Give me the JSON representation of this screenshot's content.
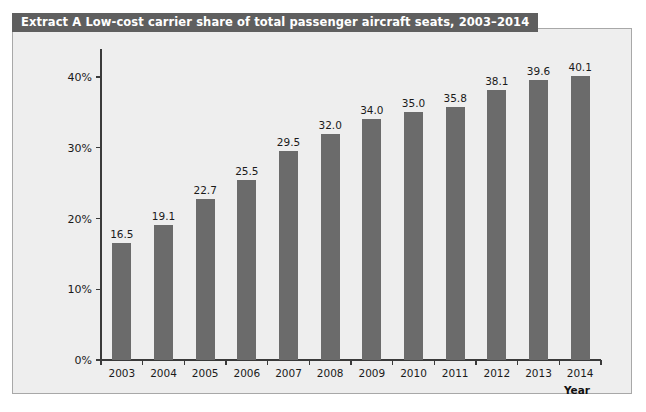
{
  "header": {
    "title": "Extract A Low-cost carrier share of total passenger aircraft seats, 2003–2014",
    "background_color": "#5f5f5f",
    "text_color": "#ffffff"
  },
  "panel": {
    "background_color": "#eeeeee",
    "border_color": "#a8a8a8"
  },
  "chart_data": {
    "type": "bar",
    "title": "Extract A Low-cost carrier share of total passenger aircraft seats, 2003–2014",
    "categories": [
      "2003",
      "2004",
      "2005",
      "2006",
      "2007",
      "2008",
      "2009",
      "2010",
      "2011",
      "2012",
      "2013",
      "2014"
    ],
    "values": [
      16.5,
      19.1,
      22.7,
      25.5,
      29.5,
      32.0,
      34.0,
      35.0,
      35.8,
      38.1,
      39.6,
      40.1
    ],
    "data_labels": [
      "16.5",
      "19.1",
      "22.7",
      "25.5",
      "29.5",
      "32.0",
      "34.0",
      "35.0",
      "35.8",
      "38.1",
      "39.6",
      "40.1"
    ],
    "xlabel": "Year",
    "ylabel": "",
    "ylim": [
      0,
      40
    ],
    "ytick_values": [
      0,
      10,
      20,
      30,
      40
    ],
    "ytick_labels": [
      "0%",
      "10%",
      "20%",
      "30%",
      "40%"
    ],
    "grid": false,
    "legend": null,
    "bar_color": "#6b6b6b",
    "axis_color": "#3a3a3a"
  }
}
